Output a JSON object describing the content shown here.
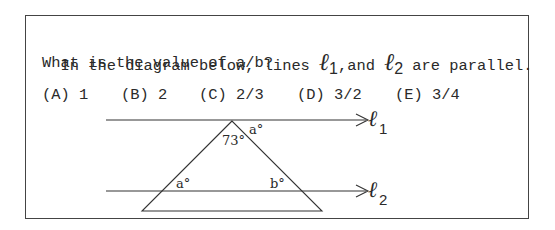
{
  "question": {
    "line1_before": "In the diagram below, lines ",
    "line1_ell1": "ℓ",
    "line1_sub1": "1",
    "line1_mid": ",and ",
    "line1_ell2": "ℓ",
    "line1_sub2": "2",
    "line1_after": " are parallel.",
    "line2": "What is the value of a/b?"
  },
  "choices": [
    {
      "label": "(A) 1"
    },
    {
      "label": "(B) 2"
    },
    {
      "label": "(C) 2/3"
    },
    {
      "label": "(D) 3/2"
    },
    {
      "label": "(E) 3/4"
    }
  ],
  "diagram": {
    "line1_name": "ℓ",
    "line1_sub": "1",
    "line2_name": "ℓ",
    "line2_sub": "2",
    "apex_angle": "73°",
    "top_right_angle": "a°",
    "lower_left_angle": "a°",
    "lower_right_angle": "b°"
  }
}
